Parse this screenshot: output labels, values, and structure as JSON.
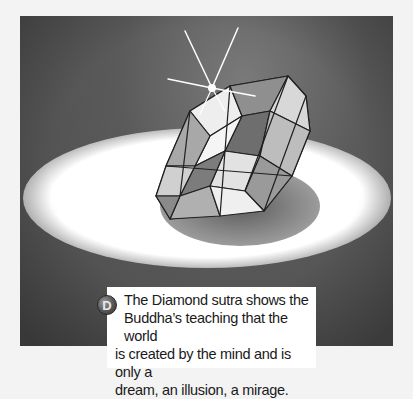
{
  "illustration": {
    "subject": "diamond-on-spotlight",
    "description": "Watercolor illustration of a faceted diamond with a starburst sparkle, resting in an oval pool of white light on a dark gray background"
  },
  "caption": {
    "badge_letter": "D",
    "line1": "The Diamond sutra shows the",
    "line2": "Buddha’s teaching that the world",
    "line3": "is created by the mind and is only a",
    "line4": "dream, an illusion, a mirage."
  },
  "colors": {
    "page_background": "#f3f3f3",
    "scene_background": "#555555",
    "spotlight": "#ffffff",
    "caption_background": "#ffffff",
    "badge": "#555555"
  }
}
